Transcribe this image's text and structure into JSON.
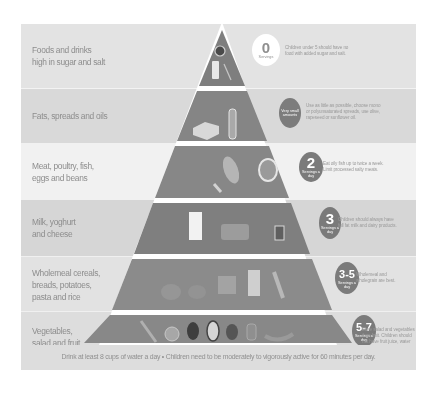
{
  "colors": {
    "band_dark": "#d9d9d9",
    "band_mid": "#e4e4e4",
    "band_light": "#f1f1f1",
    "pyramid_fill": "#8a8a8a",
    "pyramid_tip": "#7d7d7d",
    "badge_dark": "#7b7b7b",
    "badge_light": "#ffffff"
  },
  "tiers": [
    {
      "label_lines": [
        "Foods and drinks",
        "high in sugar and salt"
      ],
      "badge": {
        "number": "0",
        "unit": "Servings",
        "style": "light"
      },
      "description": [
        "Children under 5 should have no",
        "food with added sugar and salt."
      ],
      "icons": [
        "chocolate-bar-icon",
        "soft-drink-can-icon",
        "sweets-icon"
      ]
    },
    {
      "label_lines": [
        "Fats, spreads and oils"
      ],
      "badge": {
        "number": "",
        "unit": "Very small amounts",
        "style": "dark"
      },
      "description": [
        "Use as little as possible, choose mono",
        "or polyunsaturated spreads, use olive,",
        "rapeseed or sunflower oil."
      ],
      "icons": [
        "butter-icon",
        "oil-bottle-icon"
      ]
    },
    {
      "label_lines": [
        "Meat, poultry, fish,",
        "eggs and beans"
      ],
      "badge": {
        "number": "2",
        "unit": "Servings a day",
        "style": "dark"
      },
      "description": [
        "Eat oily fish up to twice a week.",
        "Limit processed salty meats."
      ],
      "icons": [
        "chicken-leg-icon",
        "fish-icon",
        "steak-icon"
      ]
    },
    {
      "label_lines": [
        "Milk, yoghurt",
        "and cheese"
      ],
      "badge": {
        "number": "3",
        "unit": "Servings a day",
        "style": "dark"
      },
      "description": [
        "Children should always have",
        "full fat milk and dairy products."
      ],
      "icons": [
        "milk-carton-icon",
        "cheese-icon",
        "yoghurt-icon"
      ]
    },
    {
      "label_lines": [
        "Wholemeal cereals,",
        "breads, potatoes,",
        "pasta and rice"
      ],
      "badge": {
        "number": "3-5",
        "unit": "Servings a day",
        "style": "dark"
      },
      "description": [
        "Wholemeal and",
        "wholegrain are best."
      ],
      "icons": [
        "bread-icon",
        "potato-icon",
        "cereal-icon",
        "pasta-icon",
        "wheat-icon"
      ]
    },
    {
      "label_lines": [
        "Vegetables,",
        "salad and fruit"
      ],
      "badge": {
        "number": "5-7",
        "unit": "Servings a day",
        "style": "dark"
      },
      "description": [
        "More salad and vegetables",
        "than fruit. Children should",
        "not have fruit juice, water",
        "is best."
      ],
      "icons": [
        "carrot-icon",
        "orange-icon",
        "broccoli-icon",
        "lettuce-icon",
        "apple-icon",
        "pepper-icon",
        "banana-icon"
      ]
    }
  ],
  "footer": {
    "text": "Drink at least 8 cups of water a day • Children need to be moderately to vigorously active for 60 minutes per day."
  }
}
